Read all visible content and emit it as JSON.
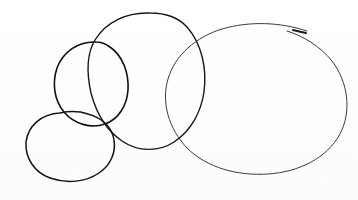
{
  "canvas": {
    "width": 358,
    "height": 200,
    "background_color": "#fdfdfc",
    "medium": "pen-on-paper-sketch",
    "subject": "four overlapping hand-drawn circles"
  },
  "shapes": [
    {
      "name": "bottom-left-small-ellipse",
      "order": 1,
      "stroke_color": "#141414",
      "stroke_width": 1.5,
      "bounds": {
        "x": 26,
        "y": 112,
        "width": 90,
        "height": 70
      },
      "center": {
        "x": 71,
        "y": 147
      },
      "radius_x": 45,
      "radius_y": 35,
      "path": "M 60 113 C 41 114 28 126 26 142 C 25 158 34 172 50 178 C 67 184 86 182 99 173 C 111 165 116 152 114 140 C 112 127 102 118 88 114 C 79 111 69 111 60 113 Z"
    },
    {
      "name": "middle-left-circle",
      "order": 2,
      "stroke_color": "#101010",
      "stroke_width": 1.6,
      "bounds": {
        "x": 55,
        "y": 41,
        "width": 73,
        "height": 86
      },
      "center": {
        "x": 92,
        "y": 84
      },
      "radius_x": 37,
      "radius_y": 43,
      "path": "M 96 42 C 78 41 63 52 57 68 C 52 83 54 100 64 112 C 74 124 91 129 105 124 C 119 119 127 105 128 90 C 129 73 123 56 110 47 C 106 44 101 42 96 42 Z"
    },
    {
      "name": "middle-large-circle",
      "order": 3,
      "stroke_color": "#181818",
      "stroke_width": 1.4,
      "bounds": {
        "x": 88,
        "y": 12,
        "width": 117,
        "height": 139
      },
      "center": {
        "x": 146,
        "y": 81
      },
      "radius_x": 58,
      "radius_y": 69,
      "path": "M 150 13 C 127 12 106 22 95 40 C 86 55 87 75 91 93 C 96 112 106 130 122 141 C 138 152 159 152 174 142 C 191 131 201 112 204 92 C 207 69 202 44 187 27 C 178 17 164 13 150 13 Z"
    },
    {
      "name": "right-large-ellipse",
      "order": 4,
      "stroke_color": "#3a3a3c",
      "stroke_width": 1.0,
      "bounds": {
        "x": 166,
        "y": 21,
        "width": 180,
        "height": 154
      },
      "center": {
        "x": 256,
        "y": 98
      },
      "radius_x": 90,
      "radius_y": 77,
      "path": "M 307 31 C 280 22 249 21 222 29 C 196 37 175 55 168 79 C 161 103 169 129 187 148 C 207 168 238 176 268 174 C 299 172 327 158 340 134 C 352 111 348 82 332 61 C 320 46 303 36 287 31",
      "has_tail_flourish": true,
      "tail": {
        "name": "pen-tail-stroke",
        "path": "M 293 30 C 297 31 301 32 306 33",
        "stroke_width": 2.0,
        "stroke_color": "#1a1a1a"
      }
    }
  ],
  "annotations": {
    "figure_label": "",
    "caption": ""
  }
}
